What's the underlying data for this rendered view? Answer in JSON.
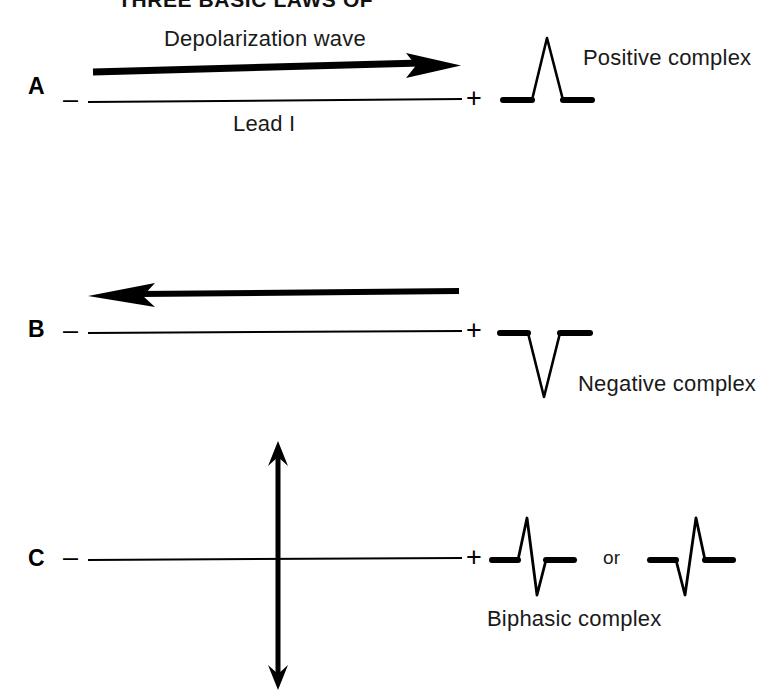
{
  "figure": {
    "title": "THREE BASIC LAWS OF",
    "title_clipped": true,
    "background_color": "#ffffff",
    "ink_color": "#000000"
  },
  "panels": [
    {
      "id": "A",
      "letter": "A",
      "arrow_label": "Depolarization wave",
      "lead_label": "Lead I",
      "negative_sign": "–",
      "positive_sign": "+",
      "arrow_direction": "right",
      "complex_label": "Positive complex",
      "complex_type": "positive"
    },
    {
      "id": "B",
      "letter": "B",
      "arrow_label": "",
      "lead_label": "",
      "negative_sign": "–",
      "positive_sign": "+",
      "arrow_direction": "left",
      "complex_label": "Negative complex",
      "complex_type": "negative"
    },
    {
      "id": "C",
      "letter": "C",
      "arrow_label": "",
      "lead_label": "",
      "negative_sign": "–",
      "positive_sign": "+",
      "arrow_direction": "vertical-double",
      "complex_label": "Biphasic complex",
      "complex_type": "biphasic",
      "conjunction": "or"
    }
  ]
}
